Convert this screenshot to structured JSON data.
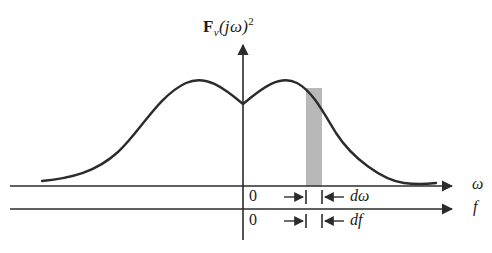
{
  "figure": {
    "title": {
      "function_bold": "F",
      "subscript": "v",
      "argument_open": "(",
      "argument_imag": "j",
      "argument_omega": "ω",
      "argument_close": ")",
      "exponent": "2",
      "full_text": "F_v(jω)^2"
    },
    "axes": {
      "vertical_axis_name": "spectral-density-axis",
      "omega_axis_label": "ω",
      "frequency_axis_label": "f",
      "omega_origin_label": "0",
      "frequency_origin_label": "0"
    },
    "annotations": {
      "omega_increment_label": "dω",
      "frequency_increment_label": "df"
    },
    "colors": {
      "curve": "#2b2b2b",
      "axis": "#2b2b2b",
      "band_fill": "#b8b8b8",
      "background": "#ffffff",
      "text": "#1a1a1a"
    }
  },
  "chart_data": {
    "type": "line",
    "xlabel": "ω",
    "ylabel": "F_v(jω)^2",
    "grid": false,
    "legend": null,
    "xlim": [
      -200,
      205
    ],
    "ylim": [
      0,
      1.05
    ],
    "x": [
      -200,
      -190,
      -180,
      -170,
      -160,
      -150,
      -140,
      -130,
      -120,
      -110,
      -100,
      -90,
      -80,
      -70,
      -60,
      -50,
      -40,
      -30,
      -20,
      -10,
      0,
      10,
      20,
      30,
      40,
      50,
      60,
      70,
      80,
      90,
      100,
      110,
      120,
      130,
      140,
      150,
      160,
      170,
      180,
      190,
      200
    ],
    "values": [
      0.03,
      0.04,
      0.05,
      0.07,
      0.1,
      0.15,
      0.22,
      0.31,
      0.42,
      0.55,
      0.68,
      0.8,
      0.89,
      0.95,
      0.98,
      0.97,
      0.93,
      0.87,
      0.81,
      0.77,
      0.755,
      0.78,
      0.83,
      0.88,
      0.93,
      0.96,
      0.97,
      0.95,
      0.9,
      0.82,
      0.72,
      0.6,
      0.48,
      0.37,
      0.28,
      0.2,
      0.14,
      0.09,
      0.06,
      0.04,
      0.03
    ],
    "peaks": [
      {
        "x": -60,
        "y": 0.98,
        "name": "left-lobe-peak"
      },
      {
        "x": 62,
        "y": 0.97,
        "name": "right-lobe-peak"
      }
    ],
    "minimum": {
      "x": 0,
      "y": 0.755,
      "name": "central-dip"
    },
    "shaded_band": {
      "label": "dω",
      "x_start": 82,
      "x_end": 99,
      "y_top": 0.86,
      "fill": "#b8b8b8"
    }
  },
  "geometry": {
    "curve_path": "M 42 181 C 72 178 96 172 118 152 C 140 132 158 96 186 83 C 206 74 224 88 243 104 C 262 88 280 74 297 83 C 312 91 322 110 336 133 C 352 158 382 180 404 183 C 418 185 428 184 436 183",
    "omega_axis": {
      "x1": 10,
      "y1": 186,
      "x2": 452,
      "y2": 186
    },
    "freq_axis": {
      "x1": 10,
      "y1": 209,
      "x2": 452,
      "y2": 209
    },
    "vertical_axis": {
      "x": 243,
      "y_top": 45,
      "y_bottom": 240
    },
    "band": {
      "x": 306,
      "width": 16,
      "y_top": 88,
      "y_bottom": 186
    },
    "tick_left_x": 306,
    "tick_right_x": 322,
    "marker_rows": [
      197,
      221
    ]
  }
}
